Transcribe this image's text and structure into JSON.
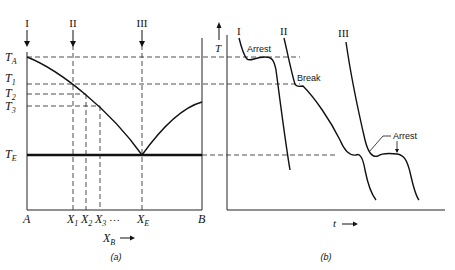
{
  "panel_a": {
    "caption": "(a)",
    "x_axis_label": "X",
    "x_axis_label_sub": "B",
    "x_axis_arrow": "→",
    "left_end_label": "A",
    "right_end_label": "B",
    "compositions": [
      {
        "label": "X",
        "sub": "1"
      },
      {
        "label": "X",
        "sub": "2"
      },
      {
        "label": "X",
        "sub": "3"
      },
      {
        "label": "…",
        "sub": ""
      },
      {
        "label": "X",
        "sub": "E"
      }
    ],
    "temperatures": [
      {
        "label": "T",
        "sub": "A"
      },
      {
        "label": "T",
        "sub": "1"
      },
      {
        "label": "T",
        "sub": "2"
      },
      {
        "label": "T",
        "sub": "3"
      },
      {
        "label": "T",
        "sub": "E"
      }
    ],
    "arrow_labels": [
      "I",
      "II",
      "III"
    ]
  },
  "panel_b": {
    "caption": "(b)",
    "y_axis_label": "T",
    "x_axis_label": "t",
    "x_axis_arrow": "→",
    "curve_labels": [
      "I",
      "II",
      "III"
    ],
    "annotations": [
      "Arrest",
      "Break",
      "Arrest"
    ]
  }
}
